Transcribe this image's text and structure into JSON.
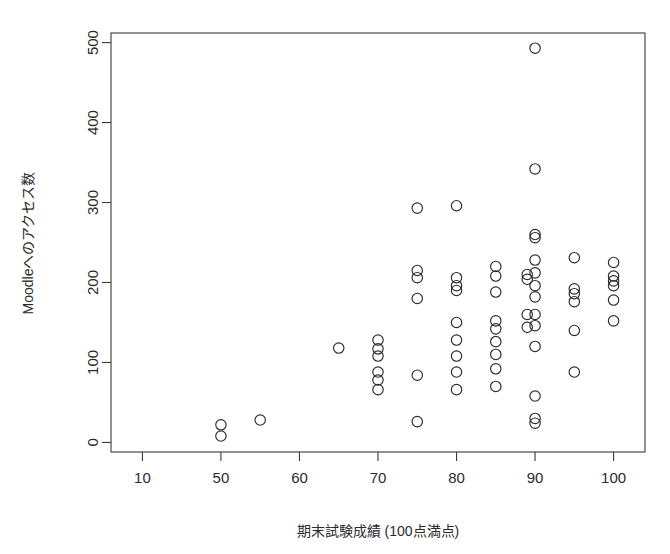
{
  "chart_data": {
    "type": "scatter",
    "title": "",
    "xlabel": "期末試験成績 (100点満点)",
    "ylabel": "Moodleへのアクセス数",
    "xlim": [
      36,
      104
    ],
    "ylim": [
      -12,
      512
    ],
    "xticks": [
      10,
      50,
      60,
      70,
      80,
      90,
      100
    ],
    "xtick_labels": [
      "10",
      "50",
      "60",
      "70",
      "80",
      "90",
      "100"
    ],
    "xtick_positions": [
      40,
      50,
      60,
      70,
      80,
      90,
      100
    ],
    "yticks": [
      0,
      100,
      200,
      300,
      400,
      500
    ],
    "ytick_labels": [
      "0",
      "100",
      "200",
      "300",
      "400",
      "500"
    ],
    "grid": false,
    "legend": null,
    "marker": "open-circle",
    "marker_color": "#2b2b2b",
    "points": [
      [
        50,
        22
      ],
      [
        50,
        8
      ],
      [
        55,
        28
      ],
      [
        65,
        118
      ],
      [
        70,
        128
      ],
      [
        70,
        117
      ],
      [
        70,
        108
      ],
      [
        70,
        88
      ],
      [
        70,
        78
      ],
      [
        70,
        66
      ],
      [
        75,
        293
      ],
      [
        75,
        215
      ],
      [
        75,
        206
      ],
      [
        75,
        180
      ],
      [
        75,
        84
      ],
      [
        75,
        26
      ],
      [
        80,
        296
      ],
      [
        80,
        206
      ],
      [
        80,
        196
      ],
      [
        80,
        190
      ],
      [
        80,
        150
      ],
      [
        80,
        128
      ],
      [
        80,
        108
      ],
      [
        80,
        88
      ],
      [
        80,
        66
      ],
      [
        85,
        220
      ],
      [
        85,
        208
      ],
      [
        85,
        188
      ],
      [
        85,
        152
      ],
      [
        85,
        142
      ],
      [
        85,
        126
      ],
      [
        85,
        110
      ],
      [
        85,
        92
      ],
      [
        85,
        70
      ],
      [
        89,
        210
      ],
      [
        89,
        204
      ],
      [
        89,
        160
      ],
      [
        89,
        144
      ],
      [
        90,
        493
      ],
      [
        90,
        342
      ],
      [
        90,
        260
      ],
      [
        90,
        256
      ],
      [
        90,
        228
      ],
      [
        90,
        212
      ],
      [
        90,
        196
      ],
      [
        90,
        182
      ],
      [
        90,
        160
      ],
      [
        90,
        146
      ],
      [
        90,
        120
      ],
      [
        90,
        58
      ],
      [
        90,
        30
      ],
      [
        90,
        24
      ],
      [
        95,
        231
      ],
      [
        95,
        192
      ],
      [
        95,
        186
      ],
      [
        95,
        176
      ],
      [
        95,
        140
      ],
      [
        95,
        88
      ],
      [
        100,
        225
      ],
      [
        100,
        208
      ],
      [
        100,
        202
      ],
      [
        100,
        196
      ],
      [
        100,
        178
      ],
      [
        100,
        152
      ]
    ]
  },
  "axis": {
    "x_label": "期末試験成績 (100点満点)",
    "y_label": "Moodleへのアクセス数"
  }
}
